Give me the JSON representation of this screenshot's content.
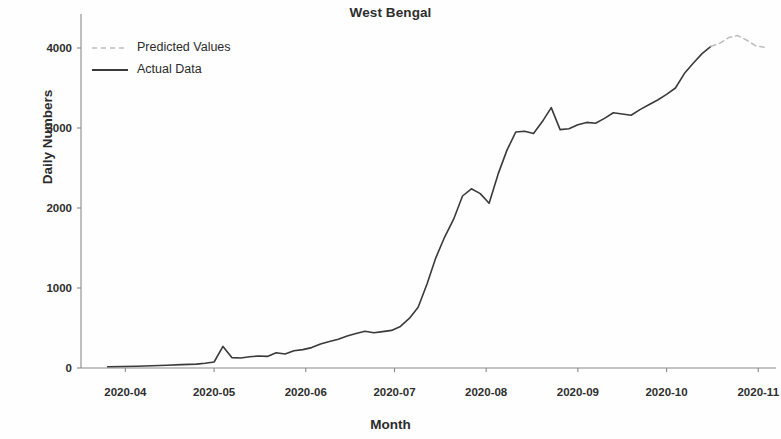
{
  "chart_data": {
    "type": "line",
    "title": "West Bengal",
    "xlabel": "Month",
    "ylabel": "Daily Numbers",
    "grid": false,
    "legend_position": "upper left",
    "xlim": [
      "2020-03-17",
      "2020-11-07"
    ],
    "ylim": [
      -180,
      4300
    ],
    "yticks": [
      0,
      1000,
      2000,
      3000,
      4000
    ],
    "ytick_labels": [
      "0",
      "1000",
      "2000",
      "3000",
      "4000"
    ],
    "xticks": [
      "2020-04",
      "2020-05",
      "2020-06",
      "2020-07",
      "2020-08",
      "2020-09",
      "2020-10",
      "2020-11"
    ],
    "xtick_labels": [
      "2020-04",
      "2020-05",
      "2020-06",
      "2020-07",
      "2020-08",
      "2020-09",
      "2020-10",
      "2020-11"
    ],
    "series": [
      {
        "name": "Actual Data",
        "style": "solid",
        "color": "#3a3a3a",
        "x": [
          "2020-03-26",
          "2020-03-31",
          "2020-04-05",
          "2020-04-10",
          "2020-04-15",
          "2020-04-20",
          "2020-04-25",
          "2020-04-28",
          "2020-05-01",
          "2020-05-04",
          "2020-05-07",
          "2020-05-10",
          "2020-05-13",
          "2020-05-16",
          "2020-05-19",
          "2020-05-22",
          "2020-05-25",
          "2020-05-28",
          "2020-05-31",
          "2020-06-03",
          "2020-06-06",
          "2020-06-09",
          "2020-06-12",
          "2020-06-15",
          "2020-06-18",
          "2020-06-21",
          "2020-06-24",
          "2020-06-27",
          "2020-06-30",
          "2020-07-03",
          "2020-07-06",
          "2020-07-09",
          "2020-07-12",
          "2020-07-15",
          "2020-07-18",
          "2020-07-21",
          "2020-07-24",
          "2020-07-27",
          "2020-07-30",
          "2020-08-02",
          "2020-08-05",
          "2020-08-08",
          "2020-08-11",
          "2020-08-14",
          "2020-08-17",
          "2020-08-20",
          "2020-08-23",
          "2020-08-26",
          "2020-08-29",
          "2020-09-01",
          "2020-09-04",
          "2020-09-07",
          "2020-09-10",
          "2020-09-13",
          "2020-09-16",
          "2020-09-19",
          "2020-09-22",
          "2020-09-25",
          "2020-09-28",
          "2020-10-01",
          "2020-10-04",
          "2020-10-07",
          "2020-10-10",
          "2020-10-13",
          "2020-10-16"
        ],
        "values": [
          15,
          18,
          22,
          28,
          35,
          42,
          48,
          60,
          75,
          270,
          130,
          125,
          140,
          150,
          145,
          190,
          175,
          215,
          230,
          255,
          300,
          330,
          360,
          400,
          430,
          460,
          440,
          455,
          470,
          520,
          620,
          760,
          1050,
          1380,
          1640,
          1860,
          2150,
          2240,
          2180,
          2060,
          2420,
          2720,
          2950,
          2960,
          2930,
          3080,
          3255,
          2980,
          2990,
          3040,
          3070,
          3060,
          3120,
          3190,
          3175,
          3160,
          3230,
          3290,
          3350,
          3420,
          3500,
          3680,
          3810,
          3930,
          4020
        ]
      },
      {
        "name": "Predicted Values",
        "style": "dashed",
        "color": "#bdbdbd",
        "x": [
          "2020-10-16",
          "2020-10-19",
          "2020-10-22",
          "2020-10-25",
          "2020-10-28",
          "2020-10-31",
          "2020-11-03"
        ],
        "values": [
          4020,
          4060,
          4130,
          4155,
          4100,
          4030,
          4010
        ]
      }
    ],
    "legend_entries": [
      {
        "label": "Predicted Values",
        "style": "dashed",
        "color": "#bdbdbd"
      },
      {
        "label": "Actual Data",
        "style": "solid",
        "color": "#3a3a3a"
      }
    ]
  }
}
